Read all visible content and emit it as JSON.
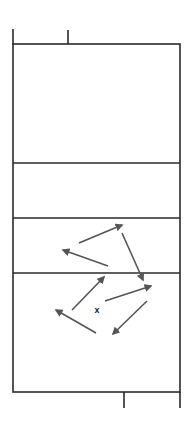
{
  "diagram": {
    "type": "volleyball-court-drill",
    "colors": {
      "court_lines": "#2a2a2a",
      "arrows": "#555555",
      "marker": "#222222",
      "background": "#ffffff"
    },
    "court": {
      "left": 13,
      "right": 180,
      "top": 44,
      "bottom": 392,
      "lines_y": [
        163,
        218,
        273
      ],
      "top_tick": {
        "x": 68,
        "y1": 30,
        "y2": 44
      },
      "left_extension": {
        "x": 13,
        "y1": 29,
        "y2": 44
      },
      "bottom_tick": {
        "x": 124,
        "y1": 392,
        "y2": 408
      },
      "right_extension": {
        "x": 180,
        "y1": 392,
        "y2": 408
      }
    },
    "marker": {
      "label": "x",
      "x": 97,
      "y": 313
    },
    "arrows": [
      {
        "from": [
          79,
          243
        ],
        "to": [
          122,
          225
        ]
      },
      {
        "from": [
          108,
          266
        ],
        "to": [
          63,
          250
        ]
      },
      {
        "from": [
          122,
          233
        ],
        "to": [
          143,
          280
        ]
      },
      {
        "from": [
          72,
          310
        ],
        "to": [
          104,
          277
        ]
      },
      {
        "from": [
          96,
          333
        ],
        "to": [
          56,
          310
        ]
      },
      {
        "from": [
          105,
          301
        ],
        "to": [
          151,
          286
        ]
      },
      {
        "from": [
          147,
          301
        ],
        "to": [
          113,
          334
        ]
      }
    ]
  }
}
